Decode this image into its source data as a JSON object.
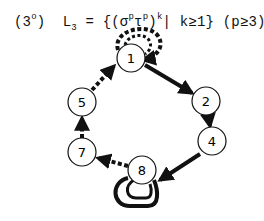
{
  "title": {
    "label": "(3",
    "degree": "o",
    "label_close": ")",
    "lang": "L",
    "lang_sub": "3",
    "eq": " = {(σ",
    "sup1": "p",
    "tau": "τ",
    "sup2": "p",
    "close": ")",
    "sup_k": "k",
    "cond": "| k≥1} (p≥3)"
  },
  "nodes": [
    {
      "id": "1",
      "x": 131,
      "y": 58
    },
    {
      "id": "2",
      "x": 206,
      "y": 101
    },
    {
      "id": "4",
      "x": 212,
      "y": 141
    },
    {
      "id": "8",
      "x": 142,
      "y": 170
    },
    {
      "id": "7",
      "x": 82,
      "y": 152
    },
    {
      "id": "5",
      "x": 82,
      "y": 102
    }
  ],
  "edges": [
    {
      "from": "1",
      "to": "2",
      "style": "solid"
    },
    {
      "from": "2",
      "to": "4",
      "style": "solid"
    },
    {
      "from": "4",
      "to": "8",
      "style": "solid"
    },
    {
      "from": "8",
      "to": "7",
      "style": "dashed"
    },
    {
      "from": "7",
      "to": "5",
      "style": "dashed"
    },
    {
      "from": "5",
      "to": "1",
      "style": "dashed"
    },
    {
      "from": "1",
      "to": "1",
      "style": "dashed-loop"
    },
    {
      "from": "8",
      "to": "8",
      "style": "solid-double-loop"
    }
  ]
}
